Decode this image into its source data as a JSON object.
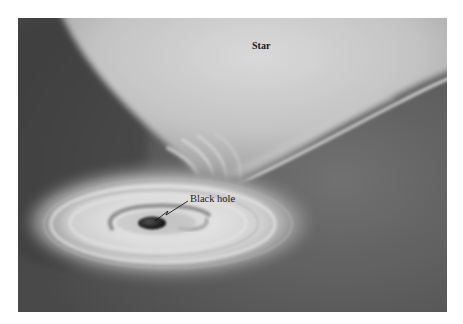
{
  "figure": {
    "labels": {
      "star": "Star",
      "black_hole": "Black hole"
    },
    "elements": [
      {
        "name": "star",
        "description": "large bright star at top, partially out of frame"
      },
      {
        "name": "mass-transfer-stream",
        "description": "gas stream flowing from star down to disk"
      },
      {
        "name": "accretion-disk",
        "description": "spiral disk of gas around black hole"
      },
      {
        "name": "black-hole",
        "description": "dark central object"
      }
    ],
    "colors": {
      "background": "#5e5e5e",
      "star_core": "#dcdcdc",
      "disk_bright": "#e8e8e8",
      "black_hole": "#222222",
      "page": "#ffffff"
    }
  }
}
